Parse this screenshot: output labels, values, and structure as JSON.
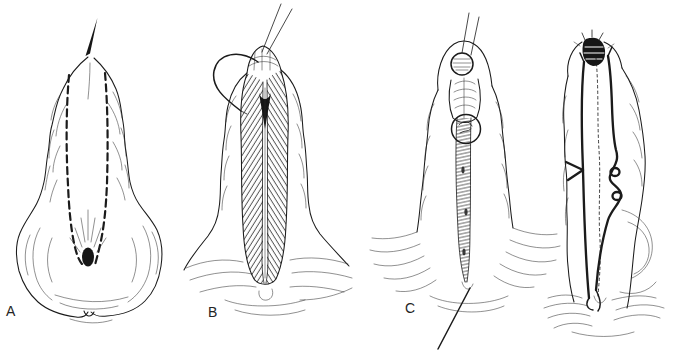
{
  "figure": {
    "background_color": "#ffffff",
    "ink_color": "#1b1b1b",
    "panels": [
      {
        "label": "A"
      },
      {
        "label": "B"
      },
      {
        "label": "C"
      }
    ]
  }
}
